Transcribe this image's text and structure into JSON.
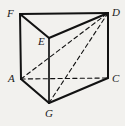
{
  "figure": {
    "kind": "geometry-diagram",
    "shape_name": "triangular prism",
    "background_color": "#f2f1ee",
    "stroke_color": "#121212",
    "width": 125,
    "height": 126,
    "vertices": [
      {
        "label": "F",
        "x": 20,
        "y": 14,
        "label_x": 7,
        "label_y": 8,
        "hidden": false
      },
      {
        "label": "D",
        "x": 108,
        "y": 13,
        "label_x": 112,
        "label_y": 7,
        "hidden": false
      },
      {
        "label": "E",
        "x": 49,
        "y": 38,
        "label_x": 38,
        "label_y": 36,
        "hidden": false
      },
      {
        "label": "A",
        "x": 21,
        "y": 79,
        "label_x": 8,
        "label_y": 73,
        "hidden": false
      },
      {
        "label": "C",
        "x": 108,
        "y": 78,
        "label_x": 112,
        "label_y": 73,
        "hidden": false
      },
      {
        "label": "G",
        "x": 49,
        "y": 103,
        "label_x": 45,
        "label_y": 108,
        "hidden": false
      }
    ],
    "edges": [
      {
        "from": "F",
        "to": "D",
        "style": "solid",
        "width": 2.1,
        "name": "edge-F-D"
      },
      {
        "from": "F",
        "to": "E",
        "style": "solid",
        "width": 2.1,
        "name": "edge-F-E"
      },
      {
        "from": "E",
        "to": "D",
        "style": "solid",
        "width": 2.1,
        "name": "edge-E-D"
      },
      {
        "from": "F",
        "to": "A",
        "style": "solid",
        "width": 2.0,
        "name": "edge-F-A"
      },
      {
        "from": "D",
        "to": "C",
        "style": "solid",
        "width": 2.0,
        "name": "edge-D-C"
      },
      {
        "from": "E",
        "to": "G",
        "style": "solid",
        "width": 1.7,
        "name": "edge-E-G"
      },
      {
        "from": "A",
        "to": "G",
        "style": "solid",
        "width": 2.1,
        "name": "edge-A-G"
      },
      {
        "from": "G",
        "to": "C",
        "style": "solid",
        "width": 2.1,
        "name": "edge-G-C"
      },
      {
        "from": "A",
        "to": "C",
        "style": "dashed",
        "width": 1.1,
        "name": "edge-A-C-hidden"
      },
      {
        "from": "A",
        "to": "D",
        "style": "dashed",
        "width": 1.1,
        "name": "diagonal-A-D"
      },
      {
        "from": "G",
        "to": "D",
        "style": "dashed",
        "width": 1.1,
        "name": "diagonal-G-D"
      }
    ]
  }
}
